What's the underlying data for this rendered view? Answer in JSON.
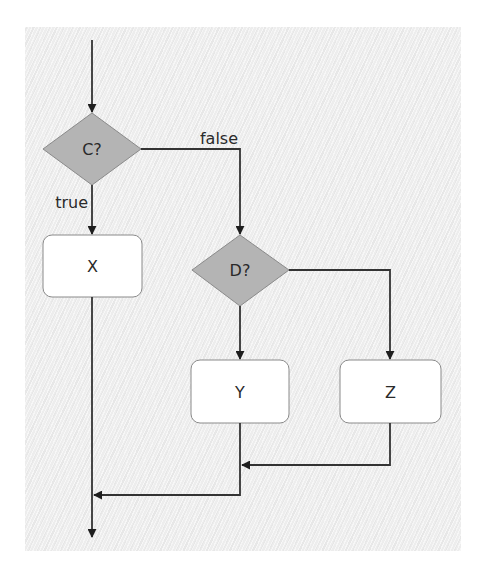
{
  "diagram": {
    "type": "flowchart",
    "colors": {
      "decision_fill": "#b4b4b4",
      "process_fill": "#ffffff",
      "stroke": "#333333",
      "node_border": "#8a8a8a",
      "background_panel": "#ededed"
    },
    "nodes": [
      {
        "id": "C",
        "kind": "decision",
        "label": "C?"
      },
      {
        "id": "X",
        "kind": "process",
        "label": "X"
      },
      {
        "id": "D",
        "kind": "decision",
        "label": "D?"
      },
      {
        "id": "Y",
        "kind": "process",
        "label": "Y"
      },
      {
        "id": "Z",
        "kind": "process",
        "label": "Z"
      }
    ],
    "edges": [
      {
        "from": "entry",
        "to": "C",
        "label": ""
      },
      {
        "from": "C",
        "to": "X",
        "label": "true"
      },
      {
        "from": "C",
        "to": "D",
        "label": "false"
      },
      {
        "from": "D",
        "to": "Y",
        "label": ""
      },
      {
        "from": "D",
        "to": "Z",
        "label": ""
      },
      {
        "from": "Z",
        "to": "merge-Y",
        "label": ""
      },
      {
        "from": "Y",
        "to": "merge-X",
        "label": ""
      },
      {
        "from": "X",
        "to": "exit",
        "label": ""
      }
    ],
    "labels": {
      "c": "C?",
      "d": "D?",
      "x": "X",
      "y": "Y",
      "z": "Z",
      "true_branch": "true",
      "false_branch": "false"
    }
  }
}
